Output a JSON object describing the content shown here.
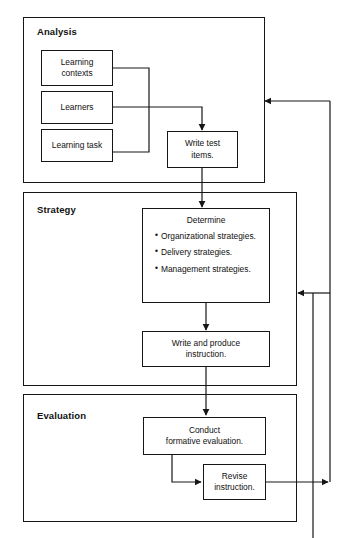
{
  "diagram": {
    "line_color": "#161616",
    "background_color": "#ffffff"
  },
  "panels": [
    {
      "id": "analysis",
      "label": "Analysis"
    },
    {
      "id": "strategy",
      "label": "Strategy"
    },
    {
      "id": "evaluation",
      "label": "Evaluation"
    }
  ],
  "nodes": {
    "learning_contexts": {
      "line1": "Learning",
      "line2": "contexts"
    },
    "learners": {
      "line1": "Learners"
    },
    "learning_task": {
      "line1": "Learning task"
    },
    "write_test_items": {
      "line1": "Write test",
      "line2": "items."
    },
    "determine": {
      "heading": "Determine",
      "bullets": [
        "Organizational strategies.",
        "Delivery strategies.",
        "Management strategies."
      ],
      "bullet_glyph": "•"
    },
    "write_produce": {
      "line1": "Write and produce",
      "line2": "instruction."
    },
    "conduct_formative": {
      "line1": "Conduct",
      "line2": "formative evaluation."
    },
    "revise": {
      "line1": "Revise",
      "line2": "instruction."
    }
  },
  "connectors": [
    {
      "id": "contexts-to-junction",
      "from": "learning_contexts",
      "to": "write_test_items",
      "arrow": false
    },
    {
      "id": "learners-to-testitems",
      "from": "learners",
      "to": "write_test_items",
      "arrow": true
    },
    {
      "id": "task-to-junction",
      "from": "learning_task",
      "to": "write_test_items",
      "arrow": false
    },
    {
      "id": "testitems-to-determine",
      "from": "write_test_items",
      "to": "determine",
      "arrow": true
    },
    {
      "id": "determine-to-write",
      "from": "determine",
      "to": "write_produce",
      "arrow": true
    },
    {
      "id": "write-to-conduct",
      "from": "write_produce",
      "to": "conduct_formative",
      "arrow": true
    },
    {
      "id": "conduct-to-revise",
      "from": "conduct_formative",
      "to": "revise",
      "arrow": true
    },
    {
      "id": "revise-to-feedback",
      "from": "revise",
      "to": "feedback-bus",
      "arrow": true
    },
    {
      "id": "feedback-to-analysis",
      "from": "feedback-bus",
      "to": "analysis",
      "arrow": true
    },
    {
      "id": "feedback-to-strategy",
      "from": "feedback-bus",
      "to": "strategy",
      "arrow": true
    }
  ]
}
